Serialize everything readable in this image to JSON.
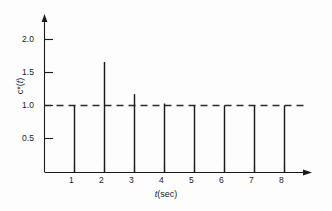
{
  "chart_data": {
    "type": "bar",
    "title": "",
    "subtitle": "",
    "xlabel": "t(sec)",
    "ylabel": "c*(t)",
    "x": [
      1,
      2,
      3,
      4,
      5,
      6,
      7,
      8
    ],
    "values": [
      1.0,
      1.65,
      1.17,
      1.03,
      1.0,
      1.0,
      1.0,
      1.0
    ],
    "categories": [
      "1",
      "2",
      "3",
      "4",
      "5",
      "6",
      "7",
      "8"
    ],
    "series": [
      {
        "name": "c*(t)",
        "values": [
          1.0,
          1.65,
          1.17,
          1.03,
          1.0,
          1.0,
          1.0,
          1.0
        ]
      }
    ],
    "xlim": [
      0,
      9.4
    ],
    "ylim": [
      0,
      2.25
    ],
    "xticks": [
      1,
      2,
      3,
      4,
      5,
      6,
      7,
      8
    ],
    "xtick_labels": [
      "1",
      "2",
      "3",
      "4",
      "5",
      "6",
      "7",
      "8"
    ],
    "yticks": [
      0.5,
      1.0,
      1.5,
      2.0
    ],
    "ytick_labels": [
      "0.5",
      "1.0",
      "1.5",
      "2.0"
    ],
    "grid": false,
    "legend": null,
    "annotations": [
      {
        "kind": "reference-line",
        "orientation": "horizontal",
        "value": 1.0,
        "style": "dashed",
        "label": ""
      }
    ],
    "style": {
      "background": "#fdfdfd",
      "axis_color": "#1b1b1b",
      "stem_color": "#1b1b1b",
      "dash_color": "#2a2a2a",
      "text_color": "#1b1b1b"
    }
  },
  "axes": {
    "y_ticks": [
      {
        "label": "2.0",
        "value": 2.0
      },
      {
        "label": "1.5",
        "value": 1.5
      },
      {
        "label": "1.0",
        "value": 1.0
      },
      {
        "label": "0.5",
        "value": 0.5
      }
    ],
    "x_ticks": [
      {
        "label": "1",
        "value": 1
      },
      {
        "label": "2",
        "value": 2
      },
      {
        "label": "3",
        "value": 3
      },
      {
        "label": "4",
        "value": 4
      },
      {
        "label": "5",
        "value": 5
      },
      {
        "label": "6",
        "value": 6
      },
      {
        "label": "7",
        "value": 7
      },
      {
        "label": "8",
        "value": 8
      }
    ],
    "x_axis_label_prefix": "t",
    "x_axis_label_suffix": "(sec)",
    "y_axis_label_prefix": "c*(",
    "y_axis_label_mid": "t",
    "y_axis_label_suffix": ")"
  }
}
